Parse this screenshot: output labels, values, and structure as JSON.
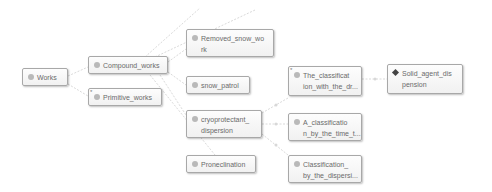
{
  "diagram": {
    "nodes": [
      {
        "id": "works",
        "label": "Works",
        "icon": "class-dot"
      },
      {
        "id": "compound",
        "label": "Compound_works",
        "icon": "class-dot"
      },
      {
        "id": "primitive",
        "label": "Primitive_works",
        "icon": "class-dot",
        "marker": "*"
      },
      {
        "id": "removed",
        "label": "Removed_snow_wo rk",
        "icon": "class-dot"
      },
      {
        "id": "patrol",
        "label": "snow_patrol",
        "icon": "class-dot"
      },
      {
        "id": "cryo",
        "label": "cryoprotectant_ dispersion",
        "icon": "class-dot"
      },
      {
        "id": "prone",
        "label": "Proneclination",
        "icon": "class-dot"
      },
      {
        "id": "classDr",
        "label": "The_classificat ion_with_the_dr...",
        "icon": "class-dot",
        "marker": "*"
      },
      {
        "id": "classTime",
        "label": "A_classificatio n_by_the_time_t...",
        "icon": "class-dot"
      },
      {
        "id": "classDisp",
        "label": "Classification_ by_the_dispersi...",
        "icon": "class-dot"
      },
      {
        "id": "solid",
        "label": "Solid_agent_dis pension",
        "icon": "individual-diamond"
      }
    ],
    "edges": [
      {
        "from": "works",
        "to": "compound"
      },
      {
        "from": "works",
        "to": "primitive"
      },
      {
        "from": "compound",
        "to": "removed"
      },
      {
        "from": "compound",
        "to": "patrol"
      },
      {
        "from": "compound",
        "to": "cryo"
      },
      {
        "from": "compound",
        "to": "prone"
      },
      {
        "from": "compound",
        "to": "offscreen-1"
      },
      {
        "from": "compound",
        "to": "offscreen-2"
      },
      {
        "from": "cryo",
        "to": "classDr"
      },
      {
        "from": "cryo",
        "to": "classTime"
      },
      {
        "from": "cryo",
        "to": "classDisp"
      },
      {
        "from": "classDr",
        "to": "solid"
      }
    ]
  }
}
